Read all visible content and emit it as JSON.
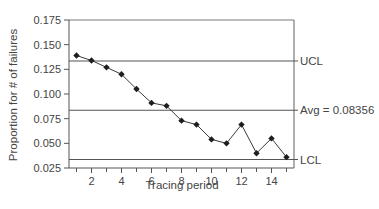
{
  "chart_data": {
    "type": "line",
    "title": "",
    "xlabel": "Tracing period",
    "ylabel": "Proportion for # of failures",
    "xlim": [
      0.5,
      15.5
    ],
    "ylim": [
      0.025,
      0.175
    ],
    "x_ticks": [
      1,
      2,
      3,
      4,
      5,
      6,
      7,
      8,
      9,
      10,
      11,
      12,
      13,
      14,
      15
    ],
    "x_tick_labels": [
      "",
      "2",
      "",
      "4",
      "",
      "6",
      "",
      "8",
      "",
      "10",
      "",
      "12",
      "",
      "14",
      ""
    ],
    "y_ticks": [
      0.025,
      0.05,
      0.075,
      0.1,
      0.125,
      0.15,
      0.175
    ],
    "y_tick_labels": [
      "0.025",
      "0.050",
      "0.075",
      "0.100",
      "0.125",
      "0.150",
      "0.175"
    ],
    "grid": false,
    "legend": null,
    "series": [
      {
        "name": "Proportion",
        "marker": "diamond",
        "x": [
          1,
          2,
          3,
          4,
          5,
          6,
          7,
          8,
          9,
          10,
          11,
          12,
          13,
          14,
          15
        ],
        "values": [
          0.139,
          0.134,
          0.127,
          0.12,
          0.105,
          0.091,
          0.088,
          0.073,
          0.069,
          0.054,
          0.05,
          0.069,
          0.04,
          0.055,
          0.036
        ]
      }
    ],
    "control_lines": [
      {
        "name": "UCL",
        "label": "UCL",
        "value": 0.1335
      },
      {
        "name": "Avg",
        "label": "Avg = 0.08356",
        "value": 0.08356
      },
      {
        "name": "LCL",
        "label": "LCL",
        "value": 0.0336
      }
    ]
  },
  "colors": {
    "line": "#3a3a3a",
    "marker": "#1e1e1e",
    "axis": "#555555",
    "text": "#444444"
  }
}
